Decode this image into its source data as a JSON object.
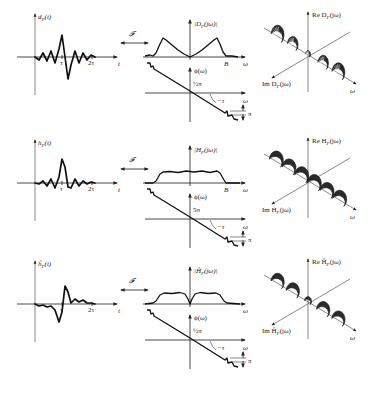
{
  "figure": {
    "caption_visible": false,
    "fourier_symbol": "𝓕",
    "rows": [
      {
        "id": "d",
        "offset_y": 0,
        "time_plot": {
          "ylabel": "d_F(t)",
          "ylabel_main": "d",
          "ylabel_sub": "F",
          "ylabel_tail": "(t)",
          "xlabel": "t",
          "tick_labels": [
            "τ",
            "2τ"
          ],
          "waveform": "oscillatory, peak at τ with large negative lobe after; symmetric ringing",
          "points": [
            [
              0,
              0
            ],
            [
              4,
              -3
            ],
            [
              8,
              4
            ],
            [
              12,
              -4
            ],
            [
              16,
              6
            ],
            [
              20,
              -6
            ],
            [
              24,
              8
            ],
            [
              27,
              22
            ],
            [
              30,
              0
            ],
            [
              33,
              -22
            ],
            [
              36,
              -8
            ],
            [
              40,
              6
            ],
            [
              44,
              -6
            ],
            [
              48,
              4
            ],
            [
              52,
              -3
            ],
            [
              56,
              2
            ],
            [
              60,
              0
            ]
          ]
        },
        "magnitude_plot": {
          "ylabel": "|D_F(jω)|",
          "ylabel_pre": "|D",
          "ylabel_sub": "F",
          "ylabel_post": "(jω)|",
          "xlabel": "ω",
          "marker_label": "B",
          "shape": "band-pass with humps near ±B, dip to zero at ω=0"
        },
        "phase_plot": {
          "ylabel": "ϕ(ω)",
          "intercept_label": "½π",
          "slope_label": "−τ",
          "jump_label": "π",
          "xlabel": "ω"
        },
        "helix_plot": {
          "z_label": "Re D_F(jω)",
          "z_pre": "Re D",
          "z_sub": "F",
          "z_post": "(jω)",
          "y_label": "Im D_F(jω)",
          "y_pre": "Im D",
          "y_sub": "F",
          "y_post": "(jω)",
          "x_label": "ω",
          "style": "two hatched helical lobes separated by a thin neck at origin"
        }
      },
      {
        "id": "h",
        "offset_y": 126,
        "time_plot": {
          "ylabel": "h_F(t)",
          "ylabel_main": "h",
          "ylabel_sub": "F",
          "ylabel_tail": "(t)",
          "xlabel": "t",
          "tick_labels": [
            "τ",
            "2τ"
          ],
          "waveform": "sinc-like pulse centred at τ",
          "points": [
            [
              0,
              0
            ],
            [
              4,
              -1
            ],
            [
              8,
              2
            ],
            [
              12,
              -3
            ],
            [
              16,
              4
            ],
            [
              20,
              -5
            ],
            [
              24,
              6
            ],
            [
              27,
              24
            ],
            [
              30,
              16
            ],
            [
              33,
              -4
            ],
            [
              36,
              -5
            ],
            [
              40,
              4
            ],
            [
              44,
              -3
            ],
            [
              48,
              2
            ],
            [
              52,
              -1
            ],
            [
              56,
              1
            ],
            [
              60,
              0
            ]
          ]
        },
        "magnitude_plot": {
          "ylabel": "|H_F(jω)|",
          "ylabel_pre": "|H",
          "ylabel_sub": "F",
          "ylabel_post": "(jω)|",
          "xlabel": "ω",
          "marker_label": "B",
          "shape": "flat low-pass up to ±B"
        },
        "phase_plot": {
          "ylabel": "ϕ(ω)",
          "intercept_label": "5π",
          "slope_label": "−τ",
          "jump_label": "π",
          "xlabel": "ω"
        },
        "helix_plot": {
          "z_label": "Re H_F(jω)",
          "z_pre": "Re H",
          "z_sub": "F",
          "z_post": "(jω)",
          "y_label": "Im H_F(jω)",
          "y_pre": "Im H",
          "y_sub": "F",
          "y_post": "(jω)",
          "x_label": "ω",
          "style": "uniform dark helix"
        }
      },
      {
        "id": "hhat",
        "offset_y": 247,
        "time_plot": {
          "ylabel": "ĥ_F(t)",
          "ylabel_main": "ĥ",
          "ylabel_sub": "F",
          "ylabel_tail": "(t)",
          "xlabel": "t",
          "tick_labels": [
            "τ",
            "2τ"
          ],
          "waveform": "antisymmetric (Hilbert-like) pulse: negative lobe before τ, positive lobe after",
          "points": [
            [
              0,
              0
            ],
            [
              4,
              -2
            ],
            [
              8,
              -1
            ],
            [
              12,
              -3
            ],
            [
              16,
              -2
            ],
            [
              20,
              -6
            ],
            [
              24,
              -18
            ],
            [
              27,
              -8
            ],
            [
              30,
              18
            ],
            [
              33,
              12
            ],
            [
              36,
              1
            ],
            [
              40,
              5
            ],
            [
              44,
              2
            ],
            [
              48,
              4
            ],
            [
              52,
              1
            ],
            [
              56,
              1
            ],
            [
              60,
              0
            ]
          ]
        },
        "magnitude_plot": {
          "ylabel": "|Ĥ_F(jω)|",
          "ylabel_pre": "|Ĥ",
          "ylabel_sub": "F",
          "ylabel_post": "(jω)|",
          "xlabel": "ω",
          "marker_label": "",
          "shape": "flat band with narrow notch at ω=0"
        },
        "phase_plot": {
          "ylabel": "ϕ(ω)",
          "intercept_label": "½π",
          "slope_label": "−τ",
          "jump_label": "π",
          "xlabel": "ω"
        },
        "helix_plot": {
          "z_label": "Re Ĥ_F(jω)",
          "z_pre": "Re Ĥ",
          "z_sub": "F",
          "z_post": "(jω)",
          "y_label": "Im Ĥ_F(jω)",
          "y_pre": "Im Ĥ",
          "y_sub": "F",
          "y_post": "(jω)",
          "x_label": "ω",
          "style": "dark helix with gap at origin"
        }
      }
    ]
  }
}
